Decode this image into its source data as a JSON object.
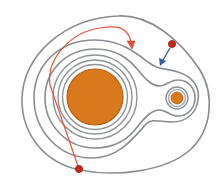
{
  "diagram": {
    "type": "equipotential contour diagram",
    "colors": {
      "contour": "#8a8d92",
      "large_body_fill": "#d9781d",
      "large_body_rim": "#b85f12",
      "small_body_fill": "#d9781d",
      "small_body_ring": "#a9b3bd",
      "red_particle": "#c8281c",
      "red_trajectory": "#e2553a",
      "blue_arrow": "#3b5aa8"
    },
    "bodies": [
      {
        "name": "large-body",
        "cx": 95,
        "cy": 97,
        "r": 28
      },
      {
        "name": "small-body",
        "cx": 177,
        "cy": 98,
        "r": 6
      }
    ],
    "particles": [
      {
        "name": "particle-top-right",
        "cx": 172,
        "cy": 44,
        "r": 3.6
      },
      {
        "name": "particle-bottom-left",
        "cx": 79,
        "cy": 169,
        "r": 3.6
      }
    ],
    "arrows": [
      {
        "name": "blue-arrow",
        "from": [
          170,
          48
        ],
        "to": [
          161,
          64
        ]
      },
      {
        "name": "red-trajectory-arrow",
        "tip": [
          132,
          47
        ]
      }
    ]
  }
}
